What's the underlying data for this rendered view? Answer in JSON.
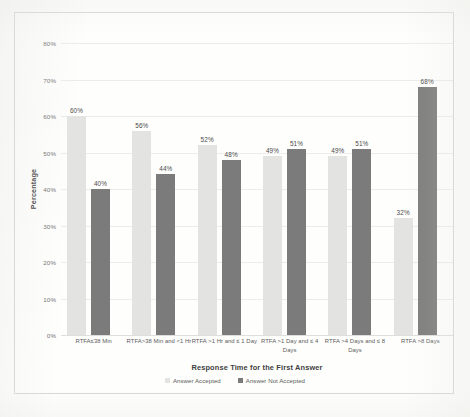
{
  "chart_data": {
    "type": "bar",
    "title": "",
    "xlabel": "Response Time for the First Answer",
    "ylabel": "Percentage",
    "ylim": [
      0,
      80
    ],
    "ytick_labels": [
      "80%",
      "70%",
      "60%",
      "50%",
      "40%",
      "30%",
      "20%",
      "10%",
      "0%"
    ],
    "ytick_values": [
      80,
      70,
      60,
      50,
      40,
      30,
      20,
      10,
      0
    ],
    "grid": true,
    "legend_position": "bottom",
    "categories": [
      "RTFA≤38 Min",
      "RTFA>38 Min and <1 Hr",
      "RTFA >1 Hr and ≤ 1 Day",
      "RTFA >1 Day and ≤ 4 Days",
      "RTFA >4 Days and ≤ 8 Days",
      "RTFA >8 Days"
    ],
    "series": [
      {
        "name": "Answer Accepted",
        "color": "#e3e3e1",
        "values": [
          60,
          56,
          52,
          49,
          49,
          32
        ],
        "labels": [
          "60%",
          "56%",
          "52%",
          "49%",
          "49%",
          "32%"
        ]
      },
      {
        "name": "Answer Not Accepted",
        "color": "#7b7b7b",
        "values": [
          40,
          44,
          48,
          51,
          51,
          68
        ],
        "labels": [
          "40%",
          "44%",
          "48%",
          "51%",
          "51%",
          "68%"
        ]
      }
    ]
  },
  "legend": {
    "items": [
      {
        "label": "Answer Accepted",
        "swatch": "accepted"
      },
      {
        "label": "Answer Not Accepted",
        "swatch": "not-accepted"
      }
    ]
  },
  "colors": {
    "series_accepted": "#e3e3e1",
    "series_not_accepted": "#7b7b7b",
    "gridline": "#ececea",
    "frame_border": "#d7d7d4",
    "axis_title_text": "#3e3e3e",
    "tick_text": "#6e6e6e"
  }
}
